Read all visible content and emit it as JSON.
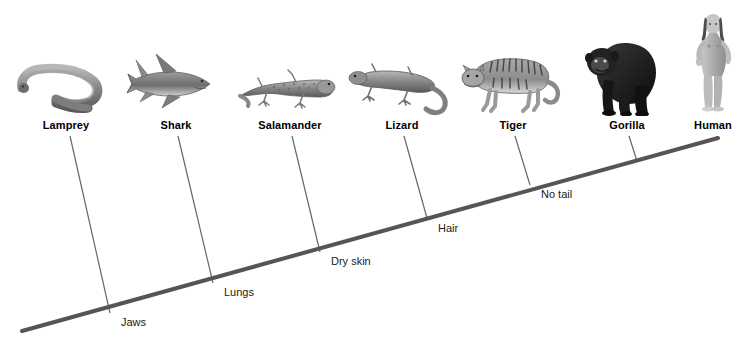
{
  "figure": {
    "type": "cladogram",
    "background_color": "#ffffff",
    "line_color": "#555555",
    "branch_color": "#666666",
    "text_color": "#000000"
  },
  "taxa": [
    {
      "name": "Lamprey",
      "label_x": 66,
      "label_y": 119,
      "branch_top_x": 70,
      "branch_top_y": 136,
      "branch_bottom_x": 110,
      "branch_bottom_y": 313,
      "icon": "lamprey-illustration",
      "icon_x": 66,
      "icon_y": 58,
      "icon_w": 100,
      "icon_h": 58
    },
    {
      "name": "Shark",
      "label_x": 176,
      "label_y": 119,
      "branch_top_x": 178,
      "branch_top_y": 136,
      "branch_bottom_x": 213,
      "branch_bottom_y": 283,
      "icon": "shark-illustration",
      "icon_x": 170,
      "icon_y": 46,
      "icon_w": 96,
      "icon_h": 70
    },
    {
      "name": "Salamander",
      "label_x": 290,
      "label_y": 119,
      "branch_top_x": 292,
      "branch_top_y": 136,
      "branch_bottom_x": 320,
      "branch_bottom_y": 252,
      "icon": "salamander-illustration",
      "icon_x": 287,
      "icon_y": 56,
      "icon_w": 106,
      "icon_h": 60
    },
    {
      "name": "Lizard",
      "label_x": 402,
      "label_y": 119,
      "branch_top_x": 404,
      "branch_top_y": 136,
      "branch_bottom_x": 427,
      "branch_bottom_y": 218,
      "icon": "lizard-illustration",
      "icon_x": 400,
      "icon_y": 52,
      "icon_w": 108,
      "icon_h": 64
    },
    {
      "name": "Tiger",
      "label_x": 513,
      "label_y": 119,
      "branch_top_x": 515,
      "branch_top_y": 136,
      "branch_bottom_x": 530,
      "branch_bottom_y": 185,
      "icon": "tiger-illustration",
      "icon_x": 510,
      "icon_y": 38,
      "icon_w": 108,
      "icon_h": 78
    },
    {
      "name": "Gorilla",
      "label_x": 627,
      "label_y": 119,
      "branch_top_x": 629,
      "branch_top_y": 136,
      "branch_bottom_x": 637,
      "branch_bottom_y": 161,
      "icon": "gorilla-illustration",
      "icon_x": 620,
      "icon_y": 18,
      "icon_w": 84,
      "icon_h": 98
    },
    {
      "name": "Human",
      "label_x": 713,
      "label_y": 119,
      "branch_top_x": 713,
      "branch_top_y": 136,
      "branch_bottom_x": 713,
      "branch_bottom_y": 139,
      "icon": "human-illustration",
      "icon_x": 713,
      "icon_y": 8,
      "icon_w": 52,
      "icon_h": 108
    }
  ],
  "traits": [
    {
      "name": "Jaws",
      "x": 121,
      "y": 316,
      "junction_x": 110,
      "junction_y": 313
    },
    {
      "name": "Lungs",
      "x": 224,
      "y": 286,
      "junction_x": 213,
      "junction_y": 283
    },
    {
      "name": "Dry skin",
      "x": 331,
      "y": 255,
      "junction_x": 320,
      "junction_y": 252
    },
    {
      "name": "Hair",
      "x": 438,
      "y": 222,
      "junction_x": 427,
      "junction_y": 218
    },
    {
      "name": "No tail",
      "x": 541,
      "y": 188,
      "junction_x": 530,
      "junction_y": 185
    }
  ],
  "main_line": {
    "x1": 22,
    "y1": 331,
    "x2": 718,
    "y2": 138,
    "width": 4
  }
}
